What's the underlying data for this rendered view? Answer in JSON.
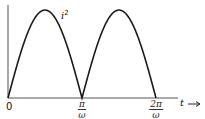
{
  "chart_data": {
    "type": "line",
    "title": "",
    "xlabel": "t",
    "ylabel": "",
    "series": [
      {
        "name": "i^2",
        "label": "i",
        "superscript": "2",
        "description": "squared sinusoidal current, |sin(ωt)|-shaped lobes, two full half-periods",
        "x": [
          "0",
          "π/(2ω)",
          "π/ω",
          "3π/(2ω)",
          "2π/ω"
        ],
        "values": [
          0,
          1,
          0,
          1,
          0
        ]
      }
    ],
    "x_ticks": [
      {
        "label": "0"
      },
      {
        "num": "π",
        "den": "ω"
      },
      {
        "num": "2π",
        "den": "ω"
      }
    ],
    "x_axis_label": "t",
    "x_axis_arrow": "⟶",
    "grid": false,
    "legend": "none"
  },
  "geom": {
    "origin_x": 8,
    "origin_y": 98,
    "y_axis_top": 5,
    "x_axis_end": 200,
    "period_px": 74,
    "peak_y": 10,
    "stroke": "#1a1a1a"
  }
}
